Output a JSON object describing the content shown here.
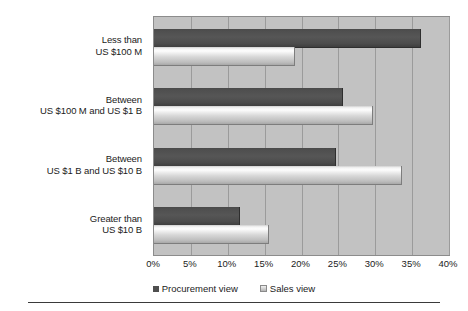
{
  "chart_data": {
    "type": "bar",
    "orientation": "horizontal",
    "title": "",
    "subtitle": "",
    "xlabel": "",
    "ylabel": "",
    "xlim": [
      0,
      40
    ],
    "xtick_labels": [
      "0%",
      "5%",
      "10%",
      "15%",
      "20%",
      "25%",
      "30%",
      "35%",
      "40%"
    ],
    "xtick_values": [
      0,
      5,
      10,
      15,
      20,
      25,
      30,
      35,
      40
    ],
    "grid": true,
    "grid_axis": "x",
    "legend_position": "bottom-center",
    "categories": [
      "Less than US $100 M",
      "Between US $100 M and US $1 B",
      "Between US $1 B and US $10 B",
      "Greater than US $10 B"
    ],
    "category_lines": [
      [
        "Less than",
        "US $100 M"
      ],
      [
        "Between",
        "US $100 M and US $1 B"
      ],
      [
        "Between",
        "US $1 B and US $10 B"
      ],
      [
        "Greater than",
        "US $10 B"
      ]
    ],
    "series": [
      {
        "name": "Procurement view",
        "color": "#4f4f4f",
        "values": [
          36.0,
          25.5,
          24.5,
          11.5
        ]
      },
      {
        "name": "Sales view",
        "color": "#d7d7d7",
        "values": [
          19.0,
          29.5,
          33.5,
          15.5
        ]
      }
    ],
    "units": "percent"
  },
  "legend": {
    "items": [
      {
        "label": "Procurement view",
        "swatch": "dark"
      },
      {
        "label": "Sales view",
        "swatch": "light"
      }
    ]
  },
  "colors": {
    "plot_background": "#c2c2c2",
    "gridline": "#9b9b9b",
    "plot_border": "#8c8c8c",
    "text": "#1b1b1b",
    "rule": "#3a3a3a"
  }
}
